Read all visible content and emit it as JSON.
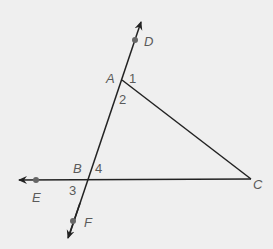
{
  "diagram": {
    "type": "geometry",
    "colors": {
      "background": "#efefef",
      "line": "#222222",
      "point": "#666666",
      "label": "#5a5a5a"
    },
    "points": [
      {
        "id": "D",
        "label": "D",
        "x": 135,
        "y": 40
      },
      {
        "id": "A",
        "label": "A",
        "x": 122,
        "y": 80
      },
      {
        "id": "B",
        "label": "B",
        "x": 88,
        "y": 180
      },
      {
        "id": "C",
        "label": "C",
        "x": 251,
        "y": 179
      },
      {
        "id": "E",
        "label": "E",
        "x": 36,
        "y": 180
      },
      {
        "id": "F",
        "label": "F",
        "x": 73,
        "y": 221
      }
    ],
    "lines": [
      {
        "name": "line DF",
        "through": [
          "D",
          "A",
          "B",
          "F"
        ],
        "arrows": "both"
      },
      {
        "name": "ray BE/line EC",
        "through": [
          "E",
          "B",
          "C"
        ],
        "arrows": "left"
      },
      {
        "name": "segment AC",
        "through": [
          "A",
          "C"
        ],
        "arrows": "none"
      }
    ],
    "angles": [
      {
        "label": "1",
        "at": "A"
      },
      {
        "label": "2",
        "at": "A"
      },
      {
        "label": "3",
        "at": "B"
      },
      {
        "label": "4",
        "at": "B"
      }
    ]
  }
}
